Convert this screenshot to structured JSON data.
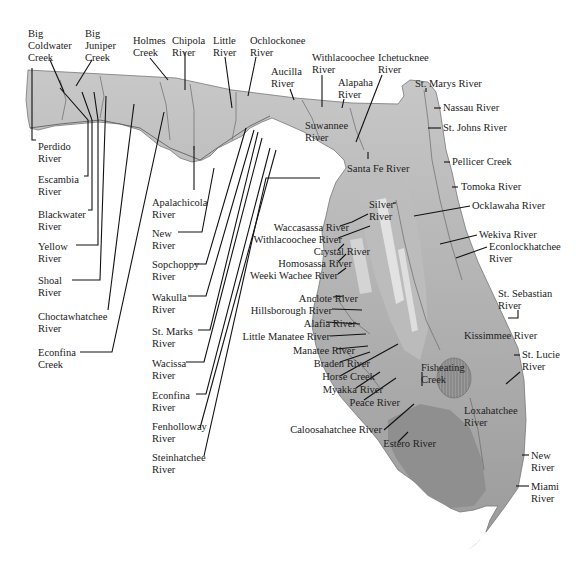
{
  "map": {
    "title": "Florida Rivers",
    "colors": {
      "panhandle_relief": "#b8b8b8",
      "peninsula_land": "#a9a9a9",
      "ridge_light": "#d8d8d8",
      "everglades": "#8f8f8f",
      "lake": "#9a9a9a",
      "leader_lines": "#111111",
      "text": "#222222",
      "background": "#ffffff"
    },
    "labels": [
      {
        "id": "big-coldwater-creek",
        "lines": [
          "Big",
          "Coldwater",
          "Creek"
        ],
        "x": 28,
        "y": 28
      },
      {
        "id": "big-juniper-creek",
        "lines": [
          "Big",
          "Juniper",
          "Creek"
        ],
        "x": 85,
        "y": 28
      },
      {
        "id": "holmes-creek",
        "lines": [
          "Holmes",
          "Creek"
        ],
        "x": 133,
        "y": 35
      },
      {
        "id": "chipola-river",
        "lines": [
          "Chipola",
          "River"
        ],
        "x": 172,
        "y": 35
      },
      {
        "id": "little-river",
        "lines": [
          "Little",
          "River"
        ],
        "x": 213,
        "y": 35
      },
      {
        "id": "ochlockonee-river",
        "lines": [
          "Ochlockonee",
          "River"
        ],
        "x": 250,
        "y": 35
      },
      {
        "id": "aucilla-river",
        "lines": [
          "Aucilla",
          "River"
        ],
        "x": 271,
        "y": 66
      },
      {
        "id": "withlacoochee-river-north",
        "lines": [
          "Withlacoochee",
          "River"
        ],
        "x": 312,
        "y": 52
      },
      {
        "id": "alapaha-river",
        "lines": [
          "Alapaha",
          "River"
        ],
        "x": 338,
        "y": 77
      },
      {
        "id": "ichetucknee-river",
        "lines": [
          "Ichetucknee",
          "River"
        ],
        "x": 378,
        "y": 52
      },
      {
        "id": "st-marys-river",
        "lines": [
          "St. Marys River"
        ],
        "x": 415,
        "y": 78
      },
      {
        "id": "nassau-river",
        "lines": [
          "Nassau River"
        ],
        "x": 443,
        "y": 102
      },
      {
        "id": "st-johns-river",
        "lines": [
          "St. Johns River"
        ],
        "x": 443,
        "y": 122
      },
      {
        "id": "suwannee-river",
        "lines": [
          "Suwannee",
          "River"
        ],
        "x": 305,
        "y": 120
      },
      {
        "id": "santa-fe-river",
        "lines": [
          "Santa Fe River"
        ],
        "x": 347,
        "y": 163
      },
      {
        "id": "pellicer-creek",
        "lines": [
          "Pellicer Creek"
        ],
        "x": 452,
        "y": 156
      },
      {
        "id": "tomoka-river",
        "lines": [
          "Tomoka River"
        ],
        "x": 461,
        "y": 181
      },
      {
        "id": "silver-river",
        "lines": [
          "Silver",
          "River"
        ],
        "x": 369,
        "y": 199
      },
      {
        "id": "ocklawaha-river",
        "lines": [
          "Ocklawaha River"
        ],
        "x": 472,
        "y": 200
      },
      {
        "id": "wekiva-river",
        "lines": [
          "Wekiva River"
        ],
        "x": 479,
        "y": 229
      },
      {
        "id": "econlockhatchee-river",
        "lines": [
          "Econlockhatchee",
          "River"
        ],
        "x": 489,
        "y": 241
      },
      {
        "id": "waccasassa-river",
        "lines": [
          "Waccasassa River"
        ],
        "x": 265,
        "y": 222,
        "align": "right"
      },
      {
        "id": "withlacoochee-river-south",
        "lines": [
          "Withlacoochee River"
        ],
        "x": 258,
        "y": 234,
        "align": "right"
      },
      {
        "id": "crystal-river",
        "lines": [
          "Crystal River"
        ],
        "x": 286,
        "y": 246,
        "align": "right"
      },
      {
        "id": "homosassa-river",
        "lines": [
          "Homosassa River"
        ],
        "x": 268,
        "y": 258,
        "align": "right"
      },
      {
        "id": "weeki-wachee-river",
        "lines": [
          "Weeki Wachee River"
        ],
        "x": 254,
        "y": 270,
        "align": "right"
      },
      {
        "id": "st-sebastian-river",
        "lines": [
          "St. Sebastian",
          "River"
        ],
        "x": 498,
        "y": 288
      },
      {
        "id": "anclote-river",
        "lines": [
          "Anclote River"
        ],
        "x": 274,
        "y": 293,
        "align": "right"
      },
      {
        "id": "hillsborough-river",
        "lines": [
          "Hillsborough River"
        ],
        "x": 248,
        "y": 305,
        "align": "right"
      },
      {
        "id": "alafia-river",
        "lines": [
          "Alafia River"
        ],
        "x": 272,
        "y": 318,
        "align": "right"
      },
      {
        "id": "kissimmee-river",
        "lines": [
          "Kissimmee River"
        ],
        "x": 464,
        "y": 330
      },
      {
        "id": "little-manatee-river",
        "lines": [
          "Little Manatee River"
        ],
        "x": 246,
        "y": 331,
        "align": "right"
      },
      {
        "id": "manatee-river",
        "lines": [
          "Manatee River"
        ],
        "x": 271,
        "y": 345,
        "align": "right"
      },
      {
        "id": "st-lucie-river",
        "lines": [
          "St. Lucie",
          "River"
        ],
        "x": 522,
        "y": 349
      },
      {
        "id": "braden-river",
        "lines": [
          "Braden River"
        ],
        "x": 286,
        "y": 358,
        "align": "right"
      },
      {
        "id": "horse-creek",
        "lines": [
          "Horse Creek"
        ],
        "x": 291,
        "y": 371,
        "align": "right"
      },
      {
        "id": "fisheating-creek",
        "lines": [
          "Fisheating",
          "Creek"
        ],
        "x": 421,
        "y": 362
      },
      {
        "id": "myakka-river",
        "lines": [
          "Myakka River"
        ],
        "x": 299,
        "y": 384,
        "align": "right"
      },
      {
        "id": "peace-river",
        "lines": [
          "Peace River"
        ],
        "x": 316,
        "y": 397,
        "align": "right"
      },
      {
        "id": "loxahatchee-river",
        "lines": [
          "Loxahatchee",
          "River"
        ],
        "x": 464,
        "y": 405
      },
      {
        "id": "caloosahatchee-river",
        "lines": [
          "Caloosahatchee River"
        ],
        "x": 298,
        "y": 424,
        "align": "right"
      },
      {
        "id": "estero-river",
        "lines": [
          "Estero River"
        ],
        "x": 352,
        "y": 438,
        "align": "right"
      },
      {
        "id": "new-river",
        "lines": [
          "New",
          "River"
        ],
        "x": 531,
        "y": 450
      },
      {
        "id": "miami-river",
        "lines": [
          "Miami",
          "River"
        ],
        "x": 531,
        "y": 481
      },
      {
        "id": "perdido-river",
        "lines": [
          "Perdido",
          "River"
        ],
        "x": 38,
        "y": 141
      },
      {
        "id": "escambia-river",
        "lines": [
          "Escambia",
          "River"
        ],
        "x": 38,
        "y": 174
      },
      {
        "id": "blackwater-river",
        "lines": [
          "Blackwater",
          "River"
        ],
        "x": 38,
        "y": 209
      },
      {
        "id": "yellow-river",
        "lines": [
          "Yellow",
          "River"
        ],
        "x": 38,
        "y": 241
      },
      {
        "id": "shoal-river",
        "lines": [
          "Shoal",
          "River"
        ],
        "x": 38,
        "y": 275
      },
      {
        "id": "choctawhatchee-river",
        "lines": [
          "Choctawhatchee",
          "River"
        ],
        "x": 38,
        "y": 311
      },
      {
        "id": "econfina-creek",
        "lines": [
          "Econfina",
          "Creek"
        ],
        "x": 38,
        "y": 347
      },
      {
        "id": "apalachicola-river",
        "lines": [
          "Apalachicola",
          "River"
        ],
        "x": 152,
        "y": 197
      },
      {
        "id": "new-river-panhandle",
        "lines": [
          "New",
          "River"
        ],
        "x": 152,
        "y": 228
      },
      {
        "id": "sopchoppy-river",
        "lines": [
          "Sopchoppy",
          "River"
        ],
        "x": 152,
        "y": 259
      },
      {
        "id": "wakulla-river",
        "lines": [
          "Wakulla",
          "River"
        ],
        "x": 152,
        "y": 292
      },
      {
        "id": "st-marks-river",
        "lines": [
          "St. Marks",
          "River"
        ],
        "x": 152,
        "y": 326
      },
      {
        "id": "wacissa-river",
        "lines": [
          "Wacissa",
          "River"
        ],
        "x": 152,
        "y": 358
      },
      {
        "id": "econfina-river",
        "lines": [
          "Econfina",
          "River"
        ],
        "x": 152,
        "y": 390
      },
      {
        "id": "fenholloway-river",
        "lines": [
          "Fenholloway",
          "River"
        ],
        "x": 152,
        "y": 421
      },
      {
        "id": "steinhatchee-river",
        "lines": [
          "Steinhatchee",
          "River"
        ],
        "x": 152,
        "y": 452
      }
    ]
  }
}
